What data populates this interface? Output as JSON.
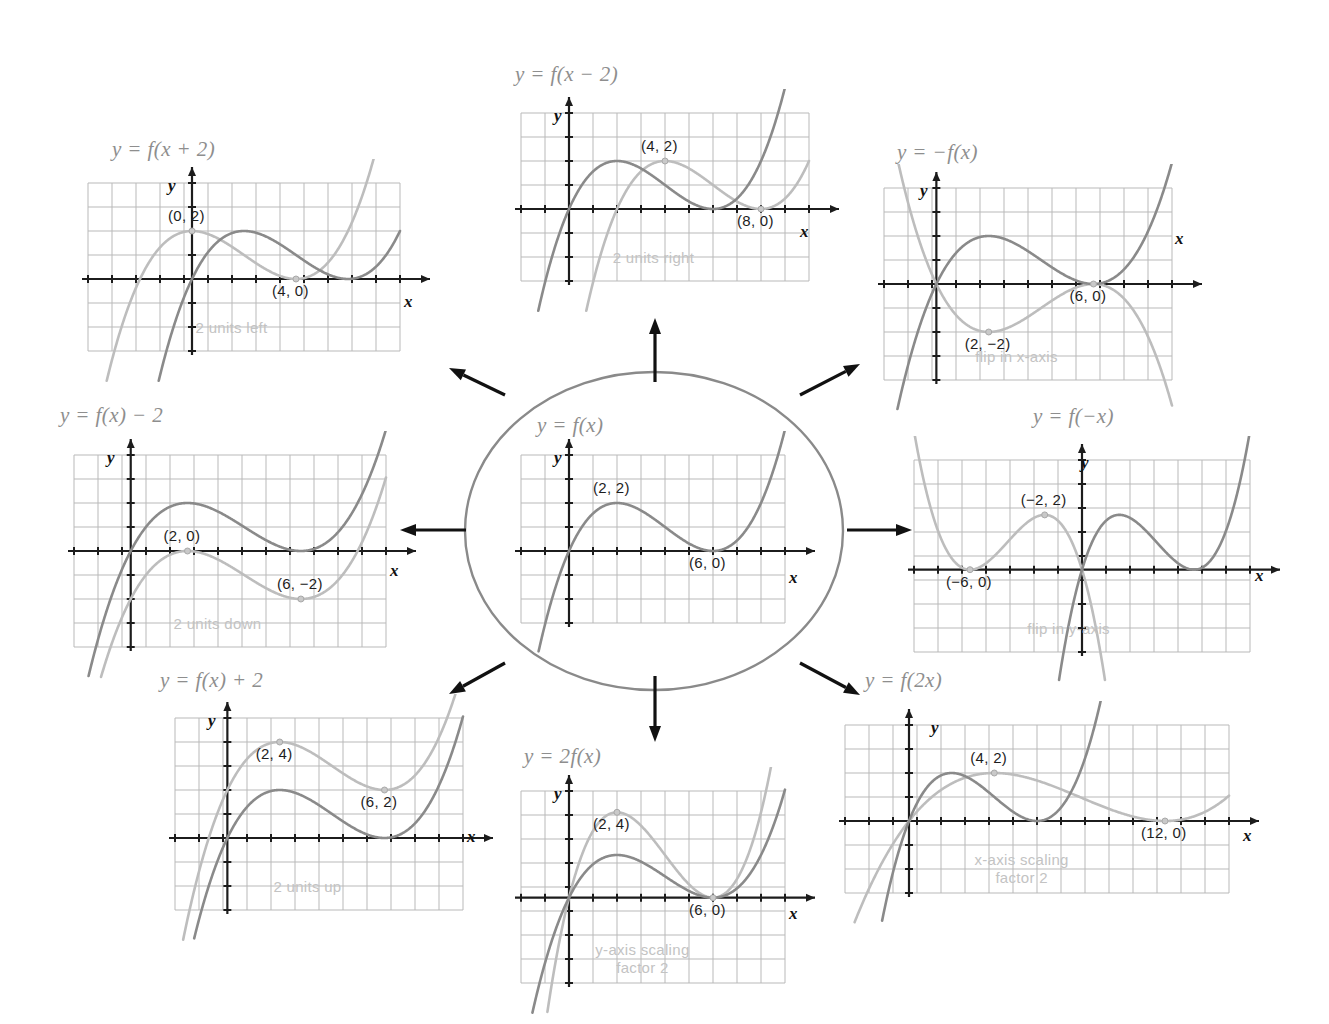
{
  "figure": {
    "kind": "function-transformation-map",
    "center_label": "y = f(x)",
    "grid_color": "#b9b9b9",
    "axis_color": "#1c1c1c",
    "original_curve_color": "#8a8a8a",
    "transformed_curve_color": "#bdbdbd",
    "title_color": "#8e8e8e",
    "caption_color": "#c3c3c3",
    "arrow_color": "#111111",
    "ellipse_color": "#8a8a8a"
  },
  "axis_labels": {
    "x": "x",
    "y": "y"
  },
  "chart_data": [
    {
      "id": "center",
      "type": "line",
      "title": "y = f(x)",
      "xlabel": "x",
      "ylabel": "y",
      "xlim": [
        -2,
        9
      ],
      "ylim": [
        -3,
        4
      ],
      "grid": true,
      "caption": "",
      "series": [
        {
          "name": "f(x)",
          "role": "original",
          "roots": [
            0,
            6
          ],
          "max": [
            2,
            2
          ],
          "min": [
            6,
            0
          ]
        }
      ],
      "points": [
        {
          "label": "(2, 2)",
          "x": 2,
          "y": 2,
          "marker": false,
          "anchor": "above"
        },
        {
          "label": "(6, 0)",
          "x": 6,
          "y": 0,
          "marker": false,
          "anchor": "below"
        }
      ]
    },
    {
      "id": "shift-left",
      "type": "line",
      "title": "y = f(x + 2)",
      "xlabel": "x",
      "ylabel": "y",
      "xlim": [
        -4,
        8
      ],
      "ylim": [
        -3,
        4
      ],
      "grid": true,
      "caption": "2 units left",
      "series": [
        {
          "name": "f(x)",
          "role": "original",
          "roots": [
            0,
            6
          ],
          "max": [
            2,
            2
          ],
          "min": [
            6,
            0
          ]
        },
        {
          "name": "f(x + 2)",
          "role": "transformed",
          "shift_x": -2,
          "roots": [
            -2,
            4
          ],
          "max": [
            0,
            2
          ],
          "min": [
            4,
            0
          ]
        }
      ],
      "points": [
        {
          "label": "(0, 2)",
          "x": 0,
          "y": 2,
          "marker": true,
          "anchor": "above"
        },
        {
          "label": "(4, 0)",
          "x": 4,
          "y": 0,
          "marker": true,
          "anchor": "below"
        }
      ]
    },
    {
      "id": "shift-right",
      "type": "line",
      "title": "y = f(x − 2)",
      "xlabel": "x",
      "ylabel": "y",
      "xlim": [
        -2,
        10
      ],
      "ylim": [
        -3,
        4
      ],
      "grid": true,
      "caption": "2 units right",
      "series": [
        {
          "name": "f(x)",
          "role": "original",
          "roots": [
            0,
            6
          ],
          "max": [
            2,
            2
          ],
          "min": [
            6,
            0
          ]
        },
        {
          "name": "f(x - 2)",
          "role": "transformed",
          "shift_x": 2,
          "roots": [
            2,
            8
          ],
          "max": [
            4,
            2
          ],
          "min": [
            8,
            0
          ]
        }
      ],
      "points": [
        {
          "label": "(4, 2)",
          "x": 4,
          "y": 2,
          "marker": true,
          "anchor": "above"
        },
        {
          "label": "(8, 0)",
          "x": 8,
          "y": 0,
          "marker": true,
          "anchor": "below"
        }
      ]
    },
    {
      "id": "reflect-x",
      "type": "line",
      "title": "y = −f(x)",
      "xlabel": "x",
      "ylabel": "y",
      "xlim": [
        -2,
        9
      ],
      "ylim": [
        -4,
        4
      ],
      "grid": true,
      "caption": "flip in x-axis",
      "series": [
        {
          "name": "f(x)",
          "role": "original",
          "roots": [
            0,
            6
          ],
          "max": [
            2,
            2
          ],
          "min": [
            6,
            0
          ]
        },
        {
          "name": "-f(x)",
          "role": "transformed",
          "scale_y": -1,
          "roots": [
            0,
            6
          ],
          "min": [
            2,
            -2
          ],
          "max": [
            6,
            0
          ]
        }
      ],
      "points": [
        {
          "label": "(6, 0)",
          "x": 6,
          "y": 0,
          "marker": true,
          "anchor": "below"
        },
        {
          "label": "(2, −2)",
          "x": 2,
          "y": -2,
          "marker": true,
          "anchor": "below"
        }
      ]
    },
    {
      "id": "shift-down",
      "type": "line",
      "title": "y = f(x) − 2",
      "xlabel": "x",
      "ylabel": "y",
      "xlim": [
        -2,
        9
      ],
      "ylim": [
        -4,
        4
      ],
      "grid": true,
      "caption": "2 units down",
      "series": [
        {
          "name": "f(x)",
          "role": "original",
          "roots": [
            0,
            6
          ],
          "max": [
            2,
            2
          ],
          "min": [
            6,
            0
          ]
        },
        {
          "name": "f(x) - 2",
          "role": "transformed",
          "shift_y": -2,
          "roots": [
            2
          ],
          "max": [
            2,
            0
          ],
          "min": [
            6,
            -2
          ]
        }
      ],
      "points": [
        {
          "label": "(2, 0)",
          "x": 2,
          "y": 0,
          "marker": true,
          "anchor": "above"
        },
        {
          "label": "(6, −2)",
          "x": 6,
          "y": -2,
          "marker": true,
          "anchor": "above"
        }
      ]
    },
    {
      "id": "reflect-y",
      "type": "line",
      "title": "y = f(−x)",
      "xlabel": "x",
      "ylabel": "y",
      "xlim": [
        -9,
        9
      ],
      "ylim": [
        -3,
        4
      ],
      "grid": true,
      "caption": "flip in y-axis",
      "series": [
        {
          "name": "f(x)",
          "role": "original",
          "roots": [
            0,
            6
          ],
          "max": [
            2,
            2
          ],
          "min": [
            6,
            0
          ]
        },
        {
          "name": "f(-x)",
          "role": "transformed",
          "scale_x": -1,
          "roots": [
            0,
            -6
          ],
          "max": [
            -2,
            2
          ],
          "min": [
            -6,
            0
          ]
        }
      ],
      "points": [
        {
          "label": "(−2, 2)",
          "x": -2,
          "y": 2,
          "marker": true,
          "anchor": "above"
        },
        {
          "label": "(−6, 0)",
          "x": -6,
          "y": 0,
          "marker": true,
          "anchor": "below"
        }
      ]
    },
    {
      "id": "shift-up",
      "type": "line",
      "title": "y = f(x) + 2",
      "xlabel": "x",
      "ylabel": "y",
      "xlim": [
        -2,
        9
      ],
      "ylim": [
        -3,
        5
      ],
      "grid": true,
      "caption": "2 units up",
      "series": [
        {
          "name": "f(x)",
          "role": "original",
          "roots": [
            0,
            6
          ],
          "max": [
            2,
            2
          ],
          "min": [
            6,
            0
          ]
        },
        {
          "name": "f(x) + 2",
          "role": "transformed",
          "shift_y": 2,
          "roots": [],
          "max": [
            2,
            4
          ],
          "min": [
            6,
            2
          ]
        }
      ],
      "points": [
        {
          "label": "(2, 4)",
          "x": 2,
          "y": 4,
          "marker": true,
          "anchor": "below"
        },
        {
          "label": "(6, 2)",
          "x": 6,
          "y": 2,
          "marker": true,
          "anchor": "below"
        }
      ]
    },
    {
      "id": "stretch-y",
      "type": "line",
      "title": "y = 2f(x)",
      "xlabel": "x",
      "ylabel": "y",
      "xlim": [
        -2,
        9
      ],
      "ylim": [
        -4,
        5
      ],
      "grid": true,
      "caption": "y-axis scaling\nfactor 2",
      "caption_lines": [
        "y-axis scaling",
        "factor 2"
      ],
      "series": [
        {
          "name": "f(x)",
          "role": "original",
          "roots": [
            0,
            6
          ],
          "max": [
            2,
            2
          ],
          "min": [
            6,
            0
          ]
        },
        {
          "name": "2f(x)",
          "role": "transformed",
          "scale_y": 2,
          "roots": [
            0,
            6
          ],
          "max": [
            2,
            4
          ],
          "min": [
            6,
            0
          ]
        }
      ],
      "points": [
        {
          "label": "(2, 4)",
          "x": 2,
          "y": 4,
          "marker": true,
          "anchor": "below"
        },
        {
          "label": "(6, 0)",
          "x": 6,
          "y": 0,
          "marker": true,
          "anchor": "below"
        }
      ]
    },
    {
      "id": "stretch-x",
      "type": "line",
      "title": "y = f(2x)",
      "xlabel": "x",
      "ylabel": "y",
      "xlim": [
        -3,
        15
      ],
      "ylim": [
        -3,
        4
      ],
      "grid": true,
      "caption": "x-axis scaling\nfactor 2",
      "caption_lines": [
        "x-axis scaling",
        "factor 2"
      ],
      "series": [
        {
          "name": "f(x)",
          "role": "original",
          "roots": [
            0,
            6
          ],
          "max": [
            2,
            2
          ],
          "min": [
            6,
            0
          ]
        },
        {
          "name": "f(2x)",
          "role": "transformed",
          "scale_x": 2,
          "roots": [
            0,
            12
          ],
          "max": [
            4,
            2
          ],
          "min": [
            12,
            0
          ]
        }
      ],
      "points": [
        {
          "label": "(4, 2)",
          "x": 4,
          "y": 2,
          "marker": true,
          "anchor": "above"
        },
        {
          "label": "(12, 0)",
          "x": 12,
          "y": 0,
          "marker": true,
          "anchor": "below"
        }
      ]
    }
  ],
  "arrows": [
    {
      "name": "arrow-to-shift-left",
      "from": [
        505,
        395
      ],
      "to": [
        449,
        368
      ]
    },
    {
      "name": "arrow-to-shift-right",
      "from": [
        655,
        382
      ],
      "to": [
        655,
        318
      ]
    },
    {
      "name": "arrow-to-reflect-x",
      "from": [
        800,
        395
      ],
      "to": [
        860,
        364
      ]
    },
    {
      "name": "arrow-to-shift-down",
      "from": [
        466,
        530
      ],
      "to": [
        400,
        530
      ]
    },
    {
      "name": "arrow-to-reflect-y",
      "from": [
        847,
        530
      ],
      "to": [
        912,
        530
      ]
    },
    {
      "name": "arrow-to-shift-up",
      "from": [
        505,
        663
      ],
      "to": [
        449,
        694
      ]
    },
    {
      "name": "arrow-to-stretch-y",
      "from": [
        655,
        676
      ],
      "to": [
        655,
        742
      ]
    },
    {
      "name": "arrow-to-stretch-x",
      "from": [
        800,
        663
      ],
      "to": [
        860,
        695
      ]
    }
  ]
}
